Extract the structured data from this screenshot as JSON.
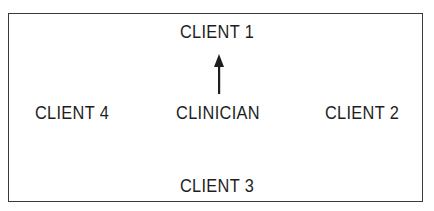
{
  "diagram": {
    "type": "seating-arrangement",
    "nodes": {
      "top": "CLIENT 1",
      "left": "CLIENT 4",
      "center": "CLINICIAN",
      "right": "CLIENT 2",
      "bottom": "CLIENT 3"
    },
    "edges": [
      {
        "from": "CLINICIAN",
        "to": "CLIENT 1",
        "style": "arrow"
      }
    ],
    "colors": {
      "border": "#3a3a3a",
      "text": "#1e1e1e",
      "background": "#ffffff"
    }
  }
}
